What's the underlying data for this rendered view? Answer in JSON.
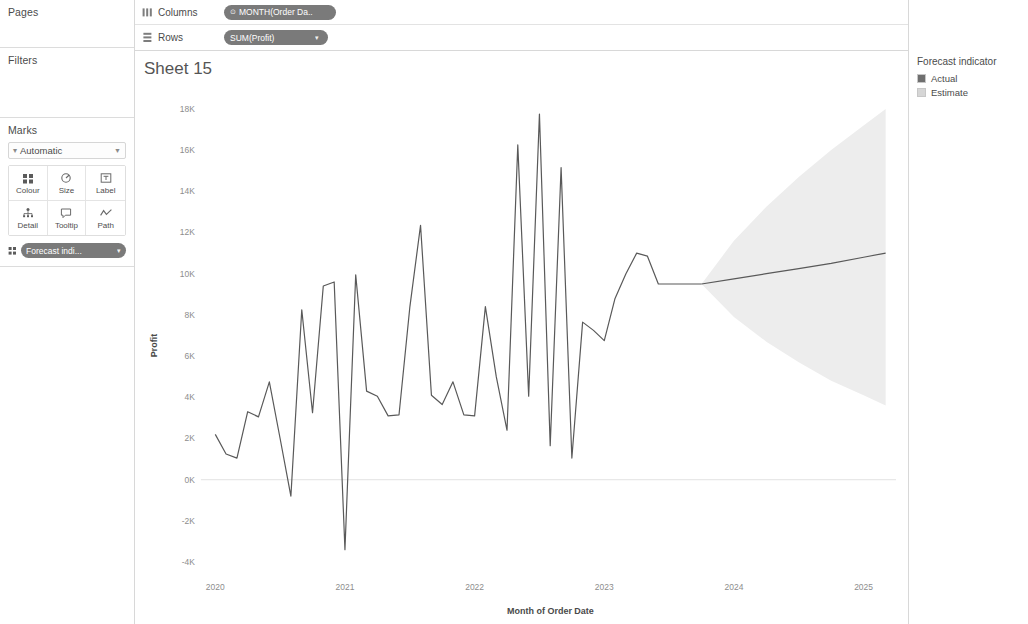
{
  "left_panel": {
    "pages_label": "Pages",
    "filters_label": "Filters",
    "marks_label": "Marks",
    "marks_type": "Automatic",
    "mark_buttons": [
      {
        "label": "Colour",
        "icon": "colour-icon"
      },
      {
        "label": "Size",
        "icon": "size-icon"
      },
      {
        "label": "Label",
        "icon": "label-icon"
      },
      {
        "label": "Detail",
        "icon": "detail-icon"
      },
      {
        "label": "Tooltip",
        "icon": "tooltip-icon"
      },
      {
        "label": "Path",
        "icon": "path-icon"
      }
    ],
    "marks_pill": "Forecast indi...",
    "marks_pill_caret": "▾"
  },
  "shelves": {
    "columns_label": "Columns",
    "columns_pill": "MONTH(Order Da..",
    "columns_pill_prefix": "⊙",
    "rows_label": "Rows",
    "rows_pill": "SUM(Profit)",
    "rows_pill_caret": "▾"
  },
  "sheet": {
    "title": "Sheet 15"
  },
  "legend": {
    "title": "Forecast indicator",
    "items": [
      {
        "label": "Actual",
        "colour": "#6f6f6f"
      },
      {
        "label": "Estimate",
        "colour": "#d6d6d6"
      }
    ]
  },
  "chart_data": {
    "type": "line",
    "title": "Sheet 15",
    "xlabel": "Month of Order Date",
    "ylabel": "Profit",
    "ylim": [
      -4000,
      18000
    ],
    "ytick_labels": [
      "18K",
      "16K",
      "14K",
      "12K",
      "10K",
      "8K",
      "6K",
      "4K",
      "2K",
      "0K",
      "-2K",
      "-4K"
    ],
    "ytick_values": [
      18000,
      16000,
      14000,
      12000,
      10000,
      8000,
      6000,
      4000,
      2000,
      0,
      -2000,
      -4000
    ],
    "xtick_labels": [
      "2020",
      "2021",
      "2022",
      "2023",
      "2024",
      "2025"
    ],
    "xtick_values": [
      2020.0,
      2021.0,
      2022.0,
      2023.0,
      2024.0,
      2025.0
    ],
    "xlim": [
      2019.92,
      2025.25
    ],
    "grid": false,
    "legend_position": "right",
    "line_colour": "#595959",
    "band_colour": "#ededed",
    "series": [
      {
        "name": "Actual",
        "x": [
          2020.0,
          2020.083,
          2020.167,
          2020.25,
          2020.333,
          2020.417,
          2020.5,
          2020.583,
          2020.667,
          2020.75,
          2020.833,
          2020.917,
          2021.0,
          2021.083,
          2021.167,
          2021.25,
          2021.333,
          2021.417,
          2021.5,
          2021.583,
          2021.667,
          2021.75,
          2021.833,
          2021.917,
          2022.0,
          2022.083,
          2022.167,
          2022.25,
          2022.333,
          2022.417,
          2022.5,
          2022.583,
          2022.667,
          2022.75,
          2022.833,
          2022.917,
          2023.0,
          2023.083,
          2023.167,
          2023.25,
          2023.333,
          2023.417,
          2023.5,
          2023.583,
          2023.667,
          2023.75
        ],
        "values": [
          2200,
          1250,
          1050,
          3300,
          3050,
          4750,
          2000,
          -800,
          8250,
          3250,
          9400,
          9600,
          -3400,
          9950,
          4300,
          4050,
          3100,
          3150,
          8350,
          12350,
          4100,
          3650,
          4750,
          3150,
          3100,
          8400,
          5000,
          2400,
          16250,
          4050,
          17750,
          1650,
          15150,
          1050,
          7650,
          7250,
          6750,
          8800,
          10000,
          11000,
          10850,
          9500,
          9500,
          9500,
          9500,
          9500
        ]
      },
      {
        "name": "Estimate",
        "x": [
          2023.75,
          2024.0,
          2024.25,
          2024.5,
          2024.75,
          2025.0,
          2025.17
        ],
        "values": [
          9500,
          9750,
          10000,
          10250,
          10500,
          10800,
          11000
        ],
        "interval_upper": [
          9500,
          11600,
          13250,
          14700,
          16000,
          17200,
          18000
        ],
        "interval_lower": [
          9500,
          7900,
          6700,
          5700,
          4800,
          4100,
          3600
        ]
      }
    ]
  }
}
